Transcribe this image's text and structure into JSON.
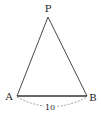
{
  "diagram": {
    "type": "triangle",
    "vertices": {
      "P": {
        "label": "P",
        "x": 48,
        "y": 17
      },
      "A": {
        "label": "A",
        "x": 17,
        "y": 96
      },
      "B": {
        "label": "B",
        "x": 87,
        "y": 96
      }
    },
    "edges": [
      {
        "from": "A",
        "to": "P",
        "style": "solid"
      },
      {
        "from": "P",
        "to": "B",
        "style": "solid"
      },
      {
        "from": "A",
        "to": "B",
        "style": "solid-bold"
      }
    ],
    "dimension": {
      "from": "A",
      "to": "B",
      "label": "10",
      "style": "dashed-arc"
    },
    "colors": {
      "stroke": "#333333",
      "dashed": "#777777",
      "text": "#222222"
    }
  }
}
